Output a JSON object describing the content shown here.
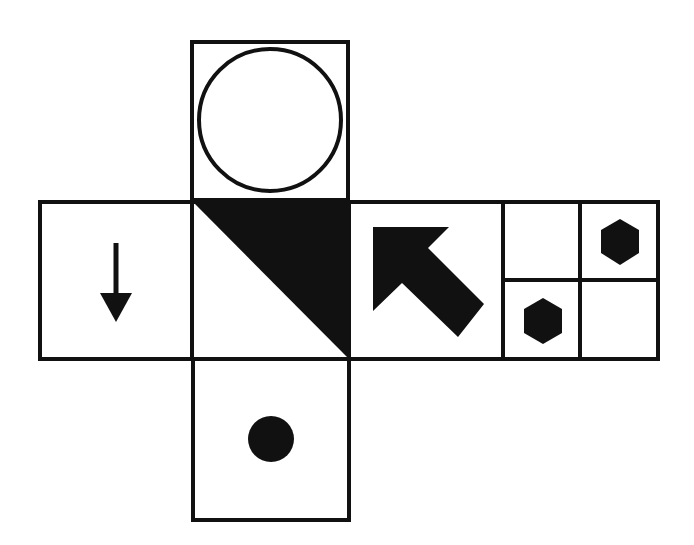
{
  "diagram": {
    "type": "cube-net",
    "stroke_color": "#111111",
    "fill_color": "#111111",
    "background": "#ffffff",
    "faces": [
      {
        "id": "top",
        "position": "above center",
        "content": "outlined circle"
      },
      {
        "id": "left",
        "position": "left of center",
        "content": "down arrow"
      },
      {
        "id": "center",
        "position": "center",
        "content": "black triangle (upper-right half, diagonal from top-left to bottom-right)"
      },
      {
        "id": "right",
        "position": "right of center",
        "content": "thick arrow pointing up-left"
      },
      {
        "id": "far-right",
        "position": "far right",
        "content": "2x2 grid: hexagon in top-right cell and bottom-left cell"
      },
      {
        "id": "bottom",
        "position": "below center",
        "content": "filled black dot"
      }
    ]
  }
}
